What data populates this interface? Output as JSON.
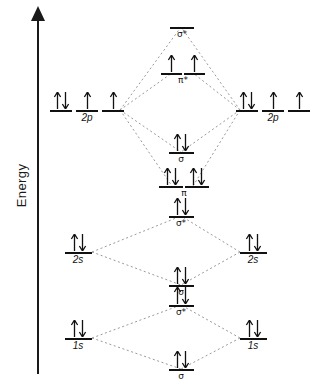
{
  "axis": {
    "label": "Energy",
    "direction": "up",
    "arrow_icon": "up-arrow-icon"
  },
  "diagram": {
    "type": "molecular-orbital-energy-diagram",
    "line_color": "#111111",
    "dash_color": "#808080",
    "background": "#ffffff"
  },
  "atomic_levels": {
    "left": [
      {
        "id": "left-2p",
        "label": "2p",
        "italic": true,
        "sublevels": 3,
        "electrons": [
          2,
          1,
          1
        ]
      },
      {
        "id": "left-2s",
        "label": "2s",
        "italic": true,
        "sublevels": 1,
        "electrons": [
          2
        ]
      },
      {
        "id": "left-1s",
        "label": "1s",
        "italic": true,
        "sublevels": 1,
        "electrons": [
          2
        ]
      }
    ],
    "right": [
      {
        "id": "right-2p",
        "label": "2p",
        "italic": true,
        "sublevels": 3,
        "electrons": [
          2,
          1,
          1
        ]
      },
      {
        "id": "right-2s",
        "label": "2s",
        "italic": true,
        "sublevels": 1,
        "electrons": [
          2
        ]
      },
      {
        "id": "right-1s",
        "label": "1s",
        "italic": true,
        "sublevels": 1,
        "electrons": [
          2
        ]
      }
    ]
  },
  "molecular_levels": [
    {
      "id": "mo-sigma-star-2p",
      "label": "σ*",
      "sublevels": 1,
      "electrons": [
        0
      ]
    },
    {
      "id": "mo-pi-star-2p",
      "label": "π*",
      "sublevels": 2,
      "electrons": [
        1,
        1
      ]
    },
    {
      "id": "mo-sigma-2p",
      "label": "σ",
      "sublevels": 1,
      "electrons": [
        2
      ]
    },
    {
      "id": "mo-pi-2p",
      "label": "π",
      "sublevels": 2,
      "electrons": [
        2,
        2
      ]
    },
    {
      "id": "mo-sigma-star-2s",
      "label": "σ*",
      "sublevels": 1,
      "electrons": [
        2
      ]
    },
    {
      "id": "mo-sigma-2s",
      "label": "σ",
      "sublevels": 1,
      "electrons": [
        2
      ]
    },
    {
      "id": "mo-sigma-star-1s",
      "label": "σ*",
      "sublevels": 1,
      "electrons": [
        2
      ]
    },
    {
      "id": "mo-sigma-1s",
      "label": "σ",
      "sublevels": 1,
      "electrons": [
        2
      ]
    }
  ],
  "labels": {
    "left_2p": "2p",
    "left_2s": "2s",
    "left_1s": "1s",
    "right_2p": "2p",
    "right_2s": "2s",
    "right_1s": "1s",
    "sigma_star_2p": "σ*",
    "pi_star_2p": "π*",
    "sigma_2p": "σ",
    "pi_2p": "π",
    "sigma_star_2s": "σ*",
    "sigma_2s": "σ",
    "sigma_star_1s": "σ*",
    "sigma_1s": "σ"
  }
}
